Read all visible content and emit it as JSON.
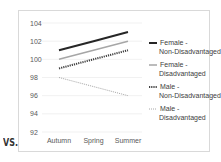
{
  "prefix_text": "VS.",
  "chart_data": {
    "type": "line",
    "title": "",
    "xlabel": "",
    "ylabel": "",
    "categories": [
      "Autumn",
      "Spring",
      "Summer"
    ],
    "ylim": [
      92,
      104
    ],
    "yticks": [
      92,
      94,
      96,
      98,
      100,
      102,
      104
    ],
    "grid": true,
    "legend_position": "right",
    "series": [
      {
        "name": "Female - Non-Disadvantaged",
        "label_lines": [
          "Female -",
          "Non-Disadvantaged"
        ],
        "values": [
          101,
          102,
          103
        ],
        "color": "#262626",
        "style": "solid-thick"
      },
      {
        "name": "Female - Disadvantaged",
        "label_lines": [
          "Female -",
          "Disadvantaged"
        ],
        "values": [
          100,
          101,
          102
        ],
        "color": "#a6a6a6",
        "style": "solid"
      },
      {
        "name": "Male - Non-Disadvantaged",
        "label_lines": [
          "Male -",
          "Non-Disadvantaged"
        ],
        "values": [
          99,
          100,
          101
        ],
        "color": "#404040",
        "style": "dotted-thick"
      },
      {
        "name": "Male - Disadvantaged",
        "label_lines": [
          "Male -",
          "Disadvantaged"
        ],
        "values": [
          98,
          97,
          96
        ],
        "color": "#a6a6a6",
        "style": "dotted"
      }
    ]
  }
}
